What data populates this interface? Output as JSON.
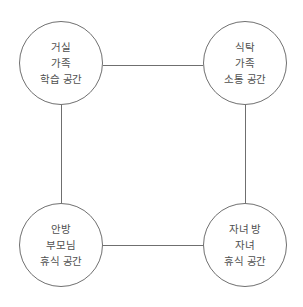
{
  "diagram": {
    "type": "four-node square relationship diagram",
    "colors": {
      "stroke": "#707070",
      "text": "#505050",
      "background": "#ffffff"
    },
    "nodes": [
      {
        "id": "living-room",
        "position": "top-left",
        "lines": [
          "거실",
          "가족",
          "학습 공간"
        ]
      },
      {
        "id": "dining-table",
        "position": "top-right",
        "lines": [
          "식탁",
          "가족",
          "소통 공간"
        ]
      },
      {
        "id": "master-bedroom",
        "position": "bottom-left",
        "lines": [
          "안방",
          "부모님",
          "휴식 공간"
        ]
      },
      {
        "id": "childrens-room",
        "position": "bottom-right",
        "lines": [
          "자녀 방",
          "자녀",
          "휴식 공간"
        ]
      }
    ],
    "edges": [
      {
        "from": "living-room",
        "to": "dining-table"
      },
      {
        "from": "living-room",
        "to": "master-bedroom"
      },
      {
        "from": "dining-table",
        "to": "childrens-room"
      },
      {
        "from": "master-bedroom",
        "to": "childrens-room"
      }
    ]
  }
}
